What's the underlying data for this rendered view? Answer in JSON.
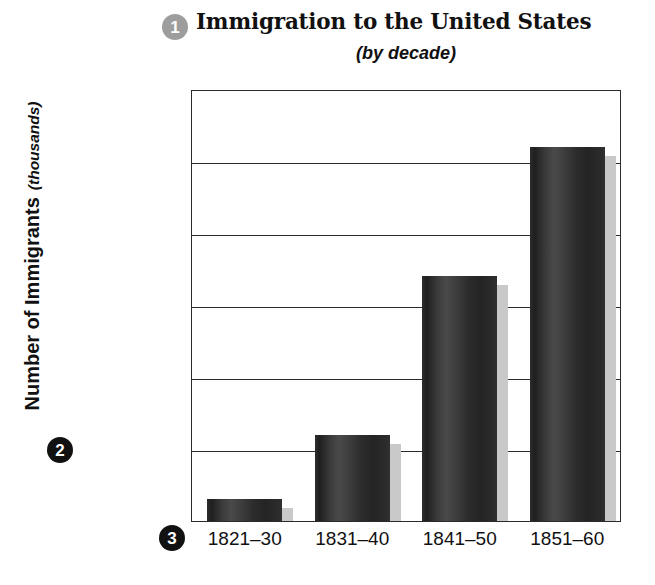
{
  "chart_data": {
    "type": "bar",
    "title": "Immigration to the United States",
    "subtitle": "(by decade)",
    "xlabel": "",
    "ylabel": "Number of Immigrants",
    "ylabel_unit": "(thousands)",
    "categories": [
      "1821–30",
      "1831–40",
      "1841–50",
      "1851–60"
    ],
    "values": [
      150,
      600,
      1700,
      2600
    ],
    "ylim": [
      0,
      3000
    ],
    "ytick_labels": [
      "0",
      "500",
      "1,000",
      "1,500",
      "2,000",
      "2,500",
      "3,000"
    ],
    "ytick_values": [
      0,
      500,
      1000,
      1500,
      2000,
      2500,
      3000
    ],
    "grid": true,
    "legend": false,
    "bar_color": "#2e2e2e",
    "bar_shadow_color": "#c9c9c9",
    "axis_color": "#2b2b2b",
    "background": "#ffffff"
  },
  "callouts": [
    {
      "label": "1",
      "target": "chart-title",
      "color": "#9d9d9d"
    },
    {
      "label": "2",
      "target": "y-axis-title",
      "color": "#111111"
    },
    {
      "label": "3",
      "target": "x-axis-labels",
      "color": "#111111"
    }
  ]
}
